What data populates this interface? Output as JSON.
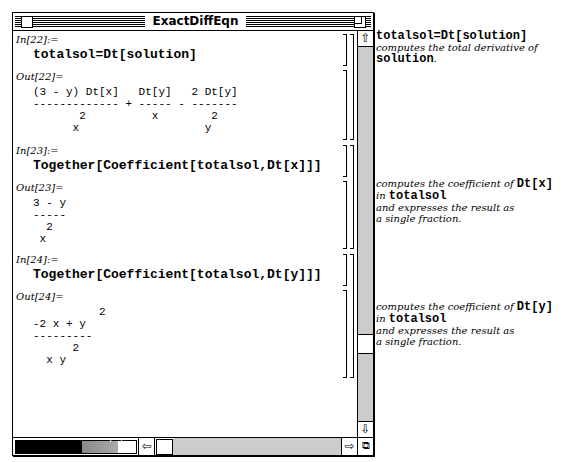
{
  "window": {
    "title": "ExactDiffEqn",
    "magnification_label": "' '"
  },
  "cells": [
    {
      "in_label": "In[22]:=",
      "input": "totalsol=Dt[solution]",
      "out_label": "Out[22]=",
      "output": "(3 - y) Dt[x]   Dt[y]   2 Dt[y]\n------------- + ----- - -------\n       2          x        2\n      x                   y"
    },
    {
      "in_label": "In[23]:=",
      "input": "Together[Coefficient[totalsol,Dt[x]]]",
      "out_label": "Out[23]=",
      "output": "3 - y\n-----\n  2\n x"
    },
    {
      "in_label": "In[24]:=",
      "input": "Together[Coefficient[totalsol,Dt[y]]]",
      "out_label": "Out[24]=",
      "output": "          2\n-2 x + y\n---------\n      2\n  x y"
    }
  ],
  "notes": [
    {
      "code1": "totalsol=Dt[solution]",
      "text1": "computes the total derivative of",
      "code2": "solution",
      "text2": "."
    },
    {
      "text1": "computes the coefficient of ",
      "code1": "Dt[x]",
      "text2": "in ",
      "code2": "totalsol",
      "text3": "and expresses the result as",
      "text4": "a single fraction."
    },
    {
      "text1": "computes the coefficient of ",
      "code1": "Dt[y]",
      "text2": "in ",
      "code2": "totalsol",
      "text3": "and expresses the result as",
      "text4": "a single fraction."
    }
  ],
  "icons": {
    "up": "⇧",
    "down": "⇩",
    "left": "⇦",
    "right": "⇨",
    "grow": "⧉"
  }
}
